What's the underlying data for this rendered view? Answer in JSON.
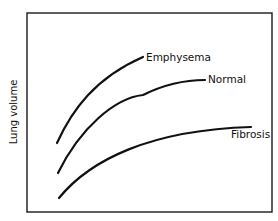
{
  "chart_data": {
    "type": "line",
    "title": "",
    "xlabel": "",
    "ylabel": "Lung volume",
    "grid": false,
    "legend": "inline labels at curve ends",
    "axis_ticks": "none",
    "frame": {
      "x": 27,
      "y": 13,
      "width": 245,
      "height": 199
    },
    "series": [
      {
        "name": "Emphysema",
        "label_pos": {
          "x": 146,
          "y": 61,
          "anchor": "start"
        },
        "path": "M57,143 C72,110 95,78 143,57"
      },
      {
        "name": "Normal",
        "label_pos": {
          "x": 208,
          "y": 83,
          "anchor": "start"
        },
        "path": "M58,173 C80,128 115,98 143,95 C165,84 185,80 205,80"
      },
      {
        "name": "Fibrosis",
        "label_pos": {
          "x": 231,
          "y": 138,
          "anchor": "start"
        },
        "path": "M59,198 C90,160 150,130 251,127"
      }
    ]
  },
  "colors": {
    "ink": "#111111",
    "background": "#ffffff"
  }
}
